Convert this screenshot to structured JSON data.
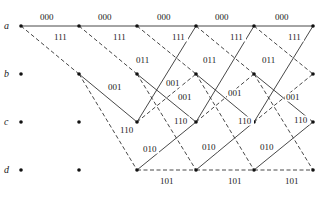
{
  "diagram": {
    "type": "trellis",
    "states": [
      {
        "id": "a",
        "label": "a",
        "y": 26
      },
      {
        "id": "b",
        "label": "b",
        "y": 74
      },
      {
        "id": "c",
        "label": "c",
        "y": 122
      },
      {
        "id": "d",
        "label": "d",
        "y": 170
      }
    ],
    "time_x": [
      21,
      79,
      137,
      196,
      254,
      313
    ],
    "edges": [
      {
        "from": "a",
        "to": "a",
        "style": "solid",
        "t": 0
      },
      {
        "from": "a",
        "to": "b",
        "style": "dashed",
        "t": 0
      },
      {
        "from": "a",
        "to": "a",
        "style": "solid",
        "t": 1
      },
      {
        "from": "a",
        "to": "b",
        "style": "dashed",
        "t": 1
      },
      {
        "from": "b",
        "to": "c",
        "style": "solid",
        "t": 1
      },
      {
        "from": "b",
        "to": "d",
        "style": "dashed",
        "t": 1
      }
    ],
    "stage_full_edges": [
      {
        "from": "a",
        "to": "a",
        "style": "solid"
      },
      {
        "from": "a",
        "to": "b",
        "style": "dashed"
      },
      {
        "from": "b",
        "to": "c",
        "style": "solid"
      },
      {
        "from": "b",
        "to": "d",
        "style": "dashed"
      },
      {
        "from": "c",
        "to": "a",
        "style": "solid"
      },
      {
        "from": "c",
        "to": "b",
        "style": "dashed"
      },
      {
        "from": "d",
        "to": "c",
        "style": "solid"
      },
      {
        "from": "d",
        "to": "d",
        "style": "dashed"
      }
    ],
    "labels": [
      {
        "text": "000",
        "x": 40,
        "y": 20
      },
      {
        "text": "000",
        "x": 98,
        "y": 20
      },
      {
        "text": "000",
        "x": 157,
        "y": 20
      },
      {
        "text": "000",
        "x": 215,
        "y": 20
      },
      {
        "text": "000",
        "x": 275,
        "y": 20
      },
      {
        "text": "111",
        "x": 54,
        "y": 40
      },
      {
        "text": "111",
        "x": 113,
        "y": 40
      },
      {
        "text": "111",
        "x": 172,
        "y": 40
      },
      {
        "text": "111",
        "x": 230,
        "y": 40
      },
      {
        "text": "111",
        "x": 288,
        "y": 40
      },
      {
        "text": "011",
        "x": 136,
        "y": 63
      },
      {
        "text": "011",
        "x": 203,
        "y": 63
      },
      {
        "text": "011",
        "x": 262,
        "y": 63
      },
      {
        "text": "001",
        "x": 108,
        "y": 90
      },
      {
        "text": "001",
        "x": 166,
        "y": 86
      },
      {
        "text": "001",
        "x": 178,
        "y": 100
      },
      {
        "text": "001",
        "x": 228,
        "y": 96
      },
      {
        "text": "001",
        "x": 286,
        "y": 100
      },
      {
        "text": "110",
        "x": 120,
        "y": 133
      },
      {
        "text": "110",
        "x": 174,
        "y": 124
      },
      {
        "text": "110",
        "x": 238,
        "y": 124
      },
      {
        "text": "110",
        "x": 294,
        "y": 123
      },
      {
        "text": "010",
        "x": 143,
        "y": 152
      },
      {
        "text": "010",
        "x": 202,
        "y": 150
      },
      {
        "text": "010",
        "x": 260,
        "y": 150
      },
      {
        "text": "101",
        "x": 160,
        "y": 184
      },
      {
        "text": "101",
        "x": 228,
        "y": 184
      },
      {
        "text": "101",
        "x": 285,
        "y": 184
      }
    ]
  }
}
